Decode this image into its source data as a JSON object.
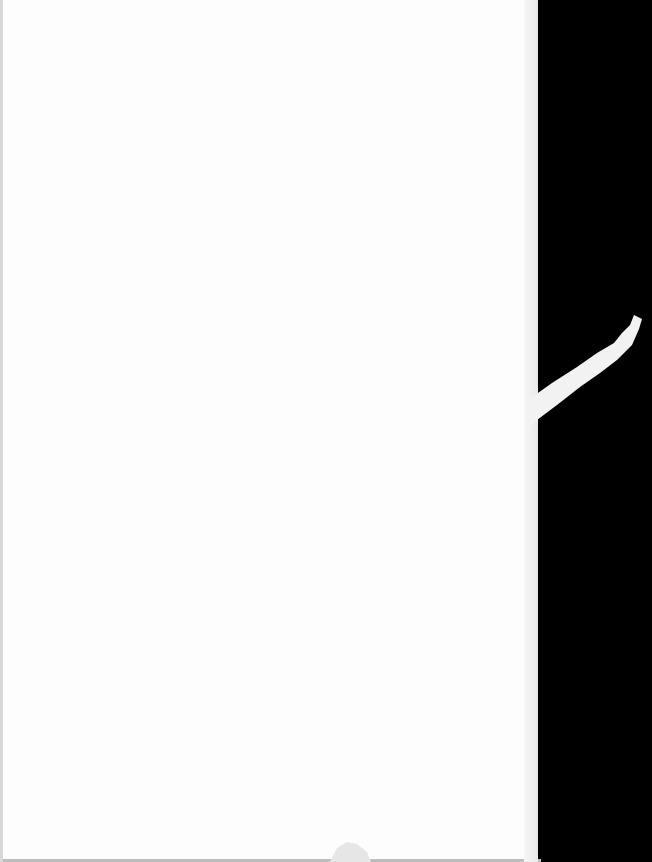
{
  "document": {
    "type": "scanned-page",
    "content": "",
    "page_color": "#fdfdfd",
    "background_color": "#000000"
  }
}
